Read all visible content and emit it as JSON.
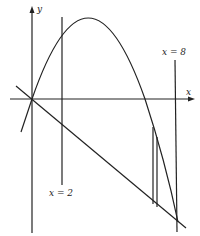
{
  "diagram": {
    "type": "area-between-curves",
    "axes": {
      "x_label": "x",
      "y_label": "y"
    },
    "vertical_lines": [
      {
        "label": "x = 2",
        "x_value": 2
      },
      {
        "label": "x = 8",
        "x_value": 8
      }
    ],
    "curves": [
      {
        "name": "parabola",
        "description": "downward-opening parabola through origin"
      },
      {
        "name": "line",
        "description": "line through origin with negative slope"
      }
    ],
    "strip": {
      "description": "thin vertical rectangular strip between curve and line"
    }
  }
}
